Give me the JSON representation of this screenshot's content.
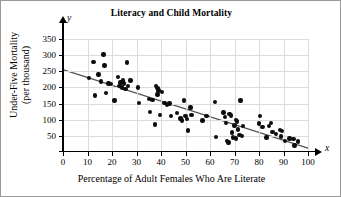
{
  "chart_data": {
    "type": "scatter",
    "title": "Literacy and Child Mortality",
    "xlabel": "Percentage of Adult Females Who Are Literate",
    "ylabel_line1": "Under-Five Mortality",
    "ylabel_line2": "(per thousand)",
    "x_axis_name": "x",
    "y_axis_name": "y",
    "xlim": [
      0,
      100
    ],
    "ylim": [
      0,
      360
    ],
    "xticks": [
      0,
      10,
      20,
      30,
      40,
      50,
      60,
      70,
      80,
      90,
      100
    ],
    "yticks": [
      50,
      100,
      150,
      200,
      250,
      300,
      350
    ],
    "grid": true,
    "legend": "none",
    "marker_color": "#0d0d0d",
    "trendline": {
      "label": "least-squares regression line",
      "color": "#555555",
      "x_start": 0,
      "y_start": 255,
      "x_end": 100,
      "y_end": 12
    },
    "points": [
      [
        10.5,
        230
      ],
      [
        12.5,
        278
      ],
      [
        13.0,
        175
      ],
      [
        14.5,
        240
      ],
      [
        15.5,
        218
      ],
      [
        16.5,
        302
      ],
      [
        17.0,
        268
      ],
      [
        17.5,
        183
      ],
      [
        18.5,
        212
      ],
      [
        19.5,
        210
      ],
      [
        21.0,
        160
      ],
      [
        22.5,
        232
      ],
      [
        23.0,
        205
      ],
      [
        23.5,
        215
      ],
      [
        24.0,
        200
      ],
      [
        24.5,
        222
      ],
      [
        25.0,
        212
      ],
      [
        25.5,
        195
      ],
      [
        26.0,
        277
      ],
      [
        26.5,
        205
      ],
      [
        27.5,
        222
      ],
      [
        30.5,
        200
      ],
      [
        31.0,
        152
      ],
      [
        35.0,
        165
      ],
      [
        35.5,
        124
      ],
      [
        36.5,
        162
      ],
      [
        37.5,
        85
      ],
      [
        38.0,
        205
      ],
      [
        38.5,
        198
      ],
      [
        38.5,
        178
      ],
      [
        39.0,
        190
      ],
      [
        39.5,
        115
      ],
      [
        40.5,
        186
      ],
      [
        41.5,
        152
      ],
      [
        42.5,
        145
      ],
      [
        43.5,
        150
      ],
      [
        44.0,
        112
      ],
      [
        46.5,
        120
      ],
      [
        48.0,
        104
      ],
      [
        48.5,
        98
      ],
      [
        49.5,
        160
      ],
      [
        50.0,
        112
      ],
      [
        50.5,
        103
      ],
      [
        51.0,
        67
      ],
      [
        52.0,
        138
      ],
      [
        52.5,
        115
      ],
      [
        57.0,
        97
      ],
      [
        58.5,
        112
      ],
      [
        62.0,
        155
      ],
      [
        62.5,
        47
      ],
      [
        65.5,
        122
      ],
      [
        66.0,
        108
      ],
      [
        66.5,
        90
      ],
      [
        67.0,
        35
      ],
      [
        67.5,
        30
      ],
      [
        68.0,
        118
      ],
      [
        68.5,
        113
      ],
      [
        69.0,
        60
      ],
      [
        69.5,
        45
      ],
      [
        70.0,
        82
      ],
      [
        70.5,
        100
      ],
      [
        70.5,
        42
      ],
      [
        71.0,
        95
      ],
      [
        71.5,
        70
      ],
      [
        72.0,
        52
      ],
      [
        72.5,
        160
      ],
      [
        73.0,
        50
      ],
      [
        73.5,
        80
      ],
      [
        80.0,
        88
      ],
      [
        80.5,
        112
      ],
      [
        81.5,
        78
      ],
      [
        83.0,
        45
      ],
      [
        84.0,
        80
      ],
      [
        85.0,
        90
      ],
      [
        85.5,
        62
      ],
      [
        87.0,
        55
      ],
      [
        88.5,
        68
      ],
      [
        89.0,
        48
      ],
      [
        89.5,
        65
      ],
      [
        90.5,
        35
      ],
      [
        92.5,
        42
      ],
      [
        94.0,
        40
      ],
      [
        94.5,
        20
      ],
      [
        96.0,
        33
      ]
    ]
  }
}
